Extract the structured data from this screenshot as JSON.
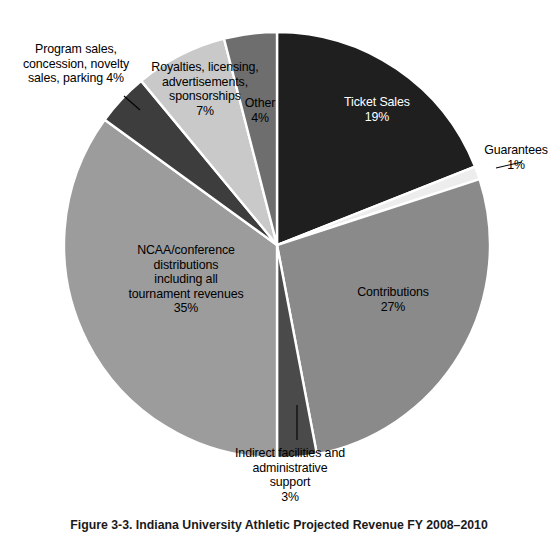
{
  "figure": {
    "caption": "Figure 3-3. Indiana University Athletic Projected Revenue FY 2008–2010",
    "caption_top": 518
  },
  "chart_data": {
    "type": "pie",
    "title": "",
    "xlabel": "",
    "ylabel": "",
    "units": "percent",
    "start_angle_deg": 0,
    "direction": "clockwise",
    "center": {
      "x": 277,
      "y": 245
    },
    "radius": 213,
    "categories": [
      "Ticket Sales",
      "Guarantees",
      "Contributions",
      "Indirect facilities and administrative support",
      "NCAA/conference distributions including all tournament revenues",
      "Program sales, concession, novelty sales, parking",
      "Royalties, licensing, advertisements, sponsorships",
      "Other"
    ],
    "values": [
      19,
      1,
      27,
      3,
      35,
      4,
      7,
      4
    ],
    "colors": [
      "#1f1f1f",
      "#ededed",
      "#8a8a8a",
      "#4a4a4a",
      "#9c9c9c",
      "#3d3d3d",
      "#c9c9c9",
      "#6e6e6e"
    ],
    "slices": [
      {
        "name": "Ticket Sales",
        "value": 19,
        "color": "#1f1f1f"
      },
      {
        "name": "Guarantees",
        "value": 1,
        "color": "#ededed"
      },
      {
        "name": "Contributions",
        "value": 27,
        "color": "#8a8a8a"
      },
      {
        "name": "Indirect facilities and administrative support",
        "value": 3,
        "color": "#4a4a4a"
      },
      {
        "name": "NCAA/conference distributions including all tournament revenues",
        "value": 35,
        "color": "#9c9c9c"
      },
      {
        "name": "Program sales, concession, novelty sales, parking",
        "value": 4,
        "color": "#3d3d3d"
      },
      {
        "name": "Royalties, licensing, advertisements, sponsorships",
        "value": 7,
        "color": "#c9c9c9"
      },
      {
        "name": "Other",
        "value": 4,
        "color": "#6e6e6e"
      }
    ],
    "legend": "none",
    "labels": [
      {
        "id": "ticket-sales",
        "text": "Ticket Sales\n19%",
        "placement": "inside",
        "on_dark": true,
        "x": 322,
        "y": 95,
        "width": 110
      },
      {
        "id": "guarantees",
        "text": "Guarantees\n1%",
        "placement": "outside",
        "on_dark": false,
        "x": 474,
        "y": 143,
        "width": 84,
        "leader": {
          "x1": 496,
          "y1": 168,
          "x2": 522,
          "y2": 162
        }
      },
      {
        "id": "contributions",
        "text": "Contributions\n27%",
        "placement": "inside",
        "on_dark": false,
        "x": 338,
        "y": 285,
        "width": 110
      },
      {
        "id": "indirect-facilities",
        "text": "Indirect facilities and\nadministrative\nsupport\n3%",
        "placement": "outside",
        "on_dark": false,
        "x": 200,
        "y": 446,
        "width": 180,
        "leader": {
          "x1": 297,
          "y1": 405,
          "x2": 297,
          "y2": 440
        }
      },
      {
        "id": "ncaa-conference",
        "text": "NCAA/conference\ndistributions\nincluding all\ntournament revenues\n35%",
        "placement": "inside",
        "on_dark": false,
        "x": 96,
        "y": 243,
        "width": 180
      },
      {
        "id": "program-sales",
        "text": "Program sales,\nconcession, novelty\nsales, parking 4%",
        "placement": "outside",
        "on_dark": false,
        "x": 8,
        "y": 42,
        "width": 136,
        "leader": {
          "x1": 124,
          "y1": 96,
          "x2": 140,
          "y2": 110
        }
      },
      {
        "id": "royalties",
        "text": "Royalties, licensing,\nadvertisements,\nsponsorships\n7%",
        "placement": "inside",
        "on_dark": false,
        "x": 142,
        "y": 60,
        "width": 126
      },
      {
        "id": "other",
        "text": "Other\n4%",
        "placement": "inside",
        "on_dark": false,
        "x": 232,
        "y": 96,
        "width": 56
      }
    ]
  }
}
